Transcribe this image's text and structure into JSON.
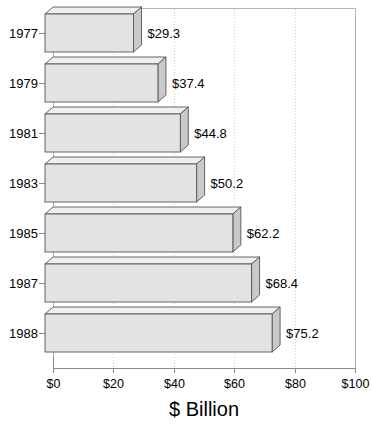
{
  "chart_data": {
    "type": "bar",
    "orientation": "horizontal",
    "style": "3d",
    "title": "$ Billion",
    "xlabel": "",
    "ylabel": "",
    "categories": [
      "1977",
      "1979",
      "1981",
      "1983",
      "1985",
      "1987",
      "1988"
    ],
    "values": [
      29.3,
      37.4,
      44.8,
      50.2,
      62.2,
      68.4,
      75.2
    ],
    "data_labels": [
      "$29.3",
      "$37.4",
      "$44.8",
      "$50.2",
      "$62.2",
      "$68.4",
      "$75.2"
    ],
    "xlim": [
      0,
      100
    ],
    "xticks": [
      0,
      20,
      40,
      60,
      80,
      100
    ],
    "xtick_labels": [
      "$0",
      "$20",
      "$40",
      "$60",
      "$80",
      "$100"
    ],
    "grid": true,
    "grid_axis": "x",
    "legend": null,
    "colors": {
      "bar_face": "#e3e3e3",
      "bar_top": "#efefef",
      "bar_side": "#c9c9c9",
      "bar_edge": "#555555",
      "grid": "#cccccc",
      "axis": "#8a8a8a",
      "frame": "#b5b5b5",
      "text": "#000000",
      "background": "#ffffff"
    }
  },
  "geometry": {
    "plot_left": 53,
    "plot_right": 355,
    "plot_top": 8,
    "plot_bottom": 368,
    "depth_x": 8,
    "depth_y": 7,
    "bar_height": 38,
    "bar_pitch": 50,
    "first_bar_top": 14
  }
}
